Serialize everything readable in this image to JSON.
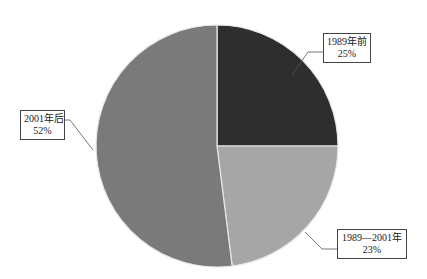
{
  "chart_data": {
    "type": "pie",
    "title": "",
    "categories": [
      "1989年前",
      "1989—2001年",
      "2001年后"
    ],
    "values": [
      25,
      23,
      52
    ],
    "unit": "%",
    "colors": [
      "#2e2e2e",
      "#a6a6a6",
      "#7a7a7a"
    ],
    "start_angle_deg": 0,
    "direction": "clockwise",
    "legend": "none",
    "data_labels": [
      {
        "name": "1989年前",
        "value": "25%"
      },
      {
        "name": "1989—2001年",
        "value": "23%"
      },
      {
        "name": "2001年后",
        "value": "52%"
      }
    ]
  }
}
